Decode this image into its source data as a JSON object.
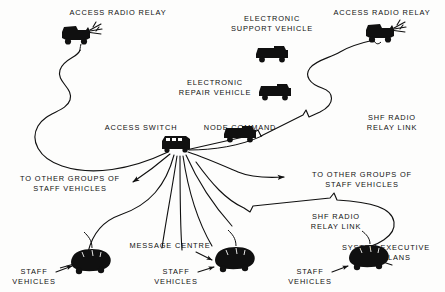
{
  "diagram": {
    "background_color": "#fdfdfc",
    "ink_color": "#101010",
    "labels": {
      "access_radio_relay_left": "ACCESS RADIO RELAY",
      "access_radio_relay_right": "ACCESS RADIO RELAY",
      "electronic_support_vehicle": "ELECTRONIC\nSUPPORT VEHICLE",
      "electronic_repair_vehicle": "ELECTRONIC\nREPAIR VEHICLE",
      "access_switch": "ACCESS SWITCH",
      "node_command": "NODE COMMAND",
      "shf_radio_relay_link_upper": "SHF RADIO\nRELAY LINK",
      "shf_radio_relay_link_lower": "SHF RADIO\nRELAY LINK",
      "to_other_groups_left": "TO OTHER GROUPS OF\nSTAFF VEHICLES",
      "to_other_groups_right": "TO OTHER GROUPS OF\nSTAFF VEHICLES",
      "staff_vehicles_left": "STAFF\nVEHICLES",
      "staff_vehicles_centre": "STAFF\nVEHICLES",
      "staff_vehicles_right": "STAFF\nVEHICLES",
      "message_centre": "MESSAGE CENTRE",
      "system_executive_and_plans": "SYSTEM EXECUTIVE\nAND PLANS"
    },
    "icons": {
      "radio_relay_left": "radio-relay-vehicle-icon",
      "radio_relay_right": "radio-relay-vehicle-icon",
      "electronic_support_vehicle": "truck-icon",
      "electronic_repair_vehicle": "truck-icon",
      "node_command": "truck-icon",
      "access_switch": "switch-vehicle-icon",
      "staff_vehicle_left": "staff-car-icon",
      "staff_vehicle_centre": "staff-car-icon",
      "staff_vehicle_right": "staff-car-icon"
    },
    "links": {
      "access_switch_to_left_relay": "serpentine-cable",
      "access_switch_to_right_relay": "shf-radio-relay-link",
      "access_switch_to_lower_right": "shf-radio-relay-link",
      "access_switch_fanout_count": 7
    }
  }
}
